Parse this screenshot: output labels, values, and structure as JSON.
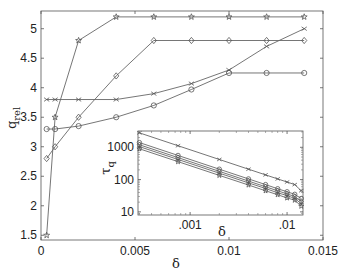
{
  "chart_data": [
    {
      "id": "main",
      "type": "line",
      "title": "",
      "xlabel": "δ",
      "ylabel": "q_rel",
      "xlim": [
        0,
        0.015
      ],
      "ylim": [
        1.42,
        5.3
      ],
      "xticks": [
        0,
        0.005,
        0.01,
        0.015
      ],
      "xtick_labels": [
        "0",
        "0.005",
        "0.01",
        "0.015"
      ],
      "yticks": [
        1.5,
        2,
        2.5,
        3,
        3.5,
        4,
        4.5,
        5
      ],
      "ytick_labels": [
        "1.5",
        "2",
        "2.5",
        "3",
        "3.5",
        "4",
        "4.5",
        "5"
      ],
      "grid": false,
      "legend": null,
      "x": [
        0.0003,
        0.00075,
        0.002,
        0.004,
        0.006,
        0.008,
        0.01,
        0.012,
        0.014
      ],
      "series": [
        {
          "name": "star",
          "marker": "star",
          "values": [
            1.5,
            3.5,
            4.8,
            5.2,
            5.2,
            5.2,
            5.2,
            5.2,
            5.2
          ]
        },
        {
          "name": "diamond",
          "marker": "diamond",
          "values": [
            2.8,
            3.0,
            3.5,
            4.2,
            4.8,
            4.8,
            4.8,
            4.8,
            4.8
          ]
        },
        {
          "name": "cross",
          "marker": "cross",
          "values": [
            3.8,
            3.8,
            3.8,
            3.8,
            3.9,
            4.07,
            4.3,
            4.7,
            5.0
          ]
        },
        {
          "name": "circle",
          "marker": "circle",
          "values": [
            3.3,
            3.3,
            3.35,
            3.5,
            3.7,
            3.97,
            4.25,
            4.25,
            4.25
          ]
        }
      ]
    },
    {
      "id": "inset",
      "type": "line",
      "scale": "log-log",
      "title": "",
      "xlabel": "δ",
      "ylabel": "τ_q",
      "xlim": [
        0.00029,
        0.0146
      ],
      "ylim": [
        8,
        3200
      ],
      "xticks": [
        0.001,
        0.01
      ],
      "xtick_labels": [
        ".001",
        ".01"
      ],
      "yticks": [
        10,
        100,
        1000
      ],
      "ytick_labels": [
        "10",
        "100",
        "1000"
      ],
      "grid": false,
      "legend": null,
      "x": [
        0.0003,
        0.00075,
        0.002,
        0.004,
        0.006,
        0.008,
        0.01,
        0.012,
        0.014
      ],
      "series": [
        {
          "name": "cross",
          "marker": "cross",
          "values": [
            2800,
            1120,
            420,
            210,
            140,
            105,
            84,
            70,
            45
          ]
        },
        {
          "name": "circle",
          "marker": "circle",
          "values": [
            1400,
            560,
            210,
            105,
            70,
            52,
            42,
            35,
            26
          ]
        },
        {
          "name": "diamond",
          "marker": "diamond",
          "values": [
            1200,
            480,
            180,
            90,
            60,
            45,
            36,
            30,
            21
          ]
        },
        {
          "name": "plus",
          "marker": "plus",
          "values": [
            1050,
            420,
            158,
            79,
            53,
            39,
            32,
            26,
            18
          ]
        },
        {
          "name": "star",
          "marker": "star",
          "values": [
            900,
            360,
            135,
            68,
            45,
            34,
            27,
            23,
            15
          ]
        }
      ]
    }
  ],
  "labels": {
    "main_xlabel": "δ",
    "main_ylabel_base": "q",
    "main_ylabel_sub": "rel",
    "inset_xlabel": "δ",
    "inset_ylabel_base": "τ",
    "inset_ylabel_sub": "q"
  }
}
